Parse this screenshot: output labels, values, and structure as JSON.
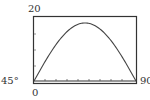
{
  "chart_data": {
    "type": "line",
    "title": "",
    "xlabel": "",
    "ylabel": "",
    "xlim": [
      0,
      90
    ],
    "ylim": [
      0,
      20
    ],
    "grid": false,
    "tick_labels": {
      "y_top": "20",
      "x_left_marker": "45°",
      "x_right": "90",
      "x_origin": "0"
    },
    "series": [
      {
        "name": "curve",
        "x": [
          0,
          10,
          20,
          30,
          40,
          45,
          50,
          60,
          70,
          80,
          90
        ],
        "y": [
          0,
          6.2,
          11.6,
          15.6,
          17.7,
          18,
          17.7,
          15.6,
          11.6,
          6.2,
          0
        ]
      }
    ],
    "peak": {
      "x": 45,
      "y": 18
    }
  },
  "labels": {
    "y_top": "20",
    "x_left": "45°",
    "x_right": "90",
    "x_zero": "0"
  },
  "colors": {
    "frame": "#333333",
    "curve": "#444444",
    "background": "#ffffff"
  }
}
